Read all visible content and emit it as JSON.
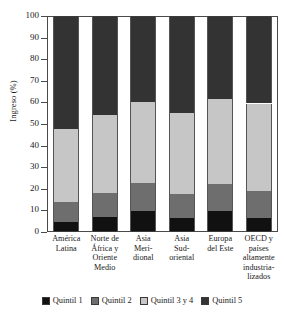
{
  "chart_data": {
    "type": "bar",
    "subtype": "stacked-bar-100",
    "title": "",
    "xlabel": "",
    "ylabel": "Ingreso (%)",
    "ylim": [
      0,
      100
    ],
    "yticks": [
      0,
      10,
      20,
      30,
      40,
      50,
      60,
      70,
      80,
      90,
      100
    ],
    "ytick_labels": [
      "0",
      "10",
      "20",
      "30",
      "40",
      "50",
      "60",
      "70",
      "80",
      "90",
      "100"
    ],
    "grid": false,
    "legend_position": "bottom",
    "categories": [
      "América Latina",
      "Norte de África y Oriente Medio",
      "Asia Meridional",
      "Asia Sudoriental",
      "Europa del Este",
      "OECD y países altamente industrializados"
    ],
    "category_lines": [
      [
        "América",
        "Latina"
      ],
      [
        "Norte de",
        "África y",
        "Oriente",
        "Medio"
      ],
      [
        "Asia",
        "Meri-",
        "dional"
      ],
      [
        "Asia",
        "Sud-",
        "oriental"
      ],
      [
        "Europa",
        "del Este"
      ],
      [
        "OECD y",
        "países",
        "altamente",
        "industria-",
        "lizados"
      ]
    ],
    "series": [
      {
        "name": "Quintil 1",
        "color": "#111111",
        "values": [
          4.5,
          7.0,
          9.5,
          6.5,
          9.5,
          6.5
        ]
      },
      {
        "name": "Quintil 2",
        "color": "#6e6e6e",
        "values": [
          9.5,
          11.0,
          13.0,
          11.0,
          12.5,
          12.5
        ]
      },
      {
        "name": "Quintil 3 y 4",
        "color": "#c6c6c6",
        "values": [
          33.5,
          36.0,
          37.5,
          37.5,
          39.5,
          40.5
        ]
      },
      {
        "name": "Quintil 5",
        "color": "#333333",
        "values": [
          52.5,
          46.0,
          40.0,
          45.0,
          38.5,
          40.5
        ]
      }
    ],
    "cumulative_tops": [
      [
        4.5,
        14.0,
        47.5,
        100
      ],
      [
        7.0,
        18.0,
        54.0,
        100
      ],
      [
        9.5,
        22.5,
        60.0,
        100
      ],
      [
        6.5,
        17.5,
        55.0,
        100
      ],
      [
        9.5,
        22.0,
        61.5,
        100
      ],
      [
        6.5,
        19.0,
        59.5,
        100
      ]
    ]
  },
  "legend": {
    "items": [
      {
        "label": "Quintil 1",
        "color": "#111111"
      },
      {
        "label": "Quintil 2",
        "color": "#6e6e6e"
      },
      {
        "label": "Quintil 3 y 4",
        "color": "#c6c6c6"
      },
      {
        "label": "Quintil 5",
        "color": "#333333"
      }
    ]
  }
}
